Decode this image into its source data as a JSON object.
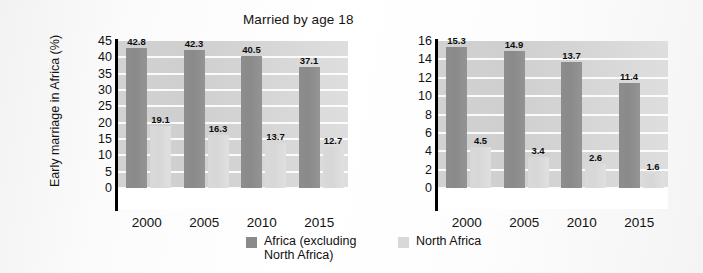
{
  "figure": {
    "y_axis_title": "Early marriage in Africa (%)"
  },
  "legend": {
    "items": [
      {
        "label": "Africa (excluding\nNorth Africa)",
        "color": "#8a8a8a",
        "icon": "legend-swatch-dark"
      },
      {
        "label": "North Africa",
        "color": "#d8d8d8",
        "icon": "legend-swatch-light"
      }
    ]
  },
  "chart_data": [
    {
      "type": "bar",
      "title": "Married by age 18",
      "xlabel": "",
      "ylabel": "Early marriage in Africa (%)",
      "categories": [
        "2000",
        "2005",
        "2010",
        "2015"
      ],
      "ylim": [
        0,
        45
      ],
      "yticks": [
        "45",
        "40",
        "35",
        "30",
        "25",
        "20",
        "15",
        "10",
        "5",
        "0"
      ],
      "grid": true,
      "legend_position": "bottom",
      "series": [
        {
          "name": "Africa (excluding North Africa)",
          "color": "#8a8a8a",
          "values": [
            42.8,
            42.3,
            40.5,
            37.1
          ],
          "labels": [
            "42.8",
            "42.3",
            "40.5",
            "37.1"
          ]
        },
        {
          "name": "North Africa",
          "color": "#d8d8d8",
          "values": [
            19.1,
            16.3,
            13.7,
            12.7
          ],
          "labels": [
            "19.1",
            "16.3",
            "13.7",
            "12.7"
          ]
        }
      ]
    },
    {
      "type": "bar",
      "title": "Married by age 15",
      "xlabel": "",
      "ylabel": "",
      "categories": [
        "2000",
        "2005",
        "2010",
        "2015"
      ],
      "ylim": [
        0,
        16
      ],
      "yticks": [
        "16",
        "14",
        "12",
        "10",
        "8",
        "6",
        "4",
        "2",
        "0"
      ],
      "grid": true,
      "legend_position": "bottom",
      "series": [
        {
          "name": "Africa (excluding North Africa)",
          "color": "#8a8a8a",
          "values": [
            15.3,
            14.9,
            13.7,
            11.4
          ],
          "labels": [
            "15.3",
            "14.9",
            "13.7",
            "11.4"
          ]
        },
        {
          "name": "North Africa",
          "color": "#d8d8d8",
          "values": [
            4.5,
            3.4,
            2.6,
            1.6
          ],
          "labels": [
            "4.5",
            "3.4",
            "2.6",
            "1.6"
          ]
        }
      ]
    }
  ]
}
